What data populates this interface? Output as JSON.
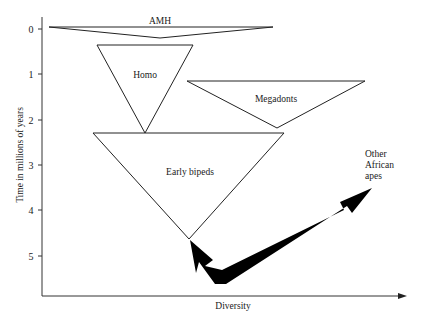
{
  "diagram": {
    "y_axis": {
      "label": "Time in millions of years",
      "ticks": [
        "0",
        "1",
        "2",
        "3",
        "4",
        "5"
      ]
    },
    "x_axis": {
      "label": "Diversity"
    },
    "groups": [
      {
        "name": "AMH",
        "label": "AMH"
      },
      {
        "name": "Homo",
        "label": "Homo"
      },
      {
        "name": "Megadonts",
        "label": "Megadonts"
      },
      {
        "name": "Early bipeds",
        "label": "Early bipeds"
      }
    ],
    "arrow_label": {
      "line1": "Other",
      "line2": "African",
      "line3": "apes"
    },
    "colors": {
      "line": "#222222",
      "arrow": "#000000",
      "background": "#ffffff"
    }
  }
}
